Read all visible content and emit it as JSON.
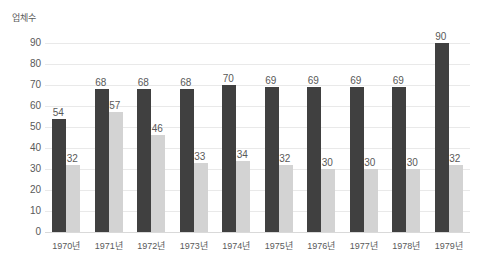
{
  "chart_data": {
    "type": "bar",
    "title": "",
    "subtitle": "",
    "xlabel": "",
    "ylabel": "업체수",
    "ylim": [
      0,
      90
    ],
    "ytick_labels": [
      "90",
      "80",
      "70",
      "60",
      "50",
      "40",
      "30",
      "20",
      "10",
      "0"
    ],
    "ytick_values": [
      90,
      80,
      70,
      60,
      50,
      40,
      30,
      20,
      10,
      0
    ],
    "grid": true,
    "legend": "none",
    "categories": [
      "1970년",
      "1971년",
      "1972년",
      "1973년",
      "1974년",
      "1975년",
      "1976년",
      "1977년",
      "1978년",
      "1979년"
    ],
    "series": [
      {
        "name": "series-1",
        "color": "#404040",
        "values": [
          54,
          68,
          68,
          68,
          70,
          69,
          69,
          69,
          69,
          90
        ],
        "labels": [
          "54",
          "68",
          "68",
          "68",
          "70",
          "69",
          "69",
          "69",
          "69",
          "90"
        ]
      },
      {
        "name": "series-2",
        "color": "#d3d3d3",
        "values": [
          32,
          57,
          46,
          33,
          34,
          32,
          30,
          30,
          30,
          32
        ],
        "labels": [
          "32",
          "57",
          "46",
          "33",
          "34",
          "32",
          "30",
          "30",
          "30",
          "32"
        ]
      }
    ]
  },
  "colors": {
    "background": "#ffffff",
    "gridline": "#e9e9e9",
    "baseline": "#d9d9d9",
    "text": "#595959",
    "series_primary": "#404040",
    "series_secondary": "#d3d3d3"
  }
}
